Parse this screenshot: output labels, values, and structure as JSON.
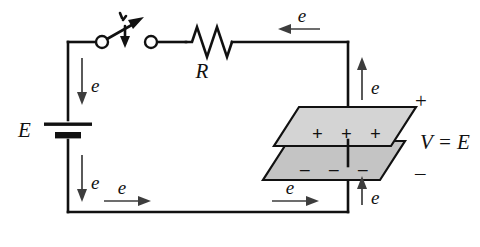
{
  "diagram": {
    "colors": {
      "wire": "#111111",
      "arrow": "#3d3d3d",
      "plate_top_fill": "#d4d4d4",
      "plate_bottom_fill": "#c4c4c4",
      "background": "#ffffff"
    }
  },
  "labels": {
    "source": "E",
    "resistor": "R",
    "voltage_relation": "V  =  E",
    "plus_sign": "+",
    "minus_sign": "–",
    "electron": "e"
  },
  "electron_arrows": [
    {
      "id": "left-upper",
      "label": "e",
      "direction": "down"
    },
    {
      "id": "left-lower",
      "label": "e",
      "direction": "down"
    },
    {
      "id": "bottom-left",
      "label": "e",
      "direction": "right"
    },
    {
      "id": "bottom-right",
      "label": "e",
      "direction": "right"
    },
    {
      "id": "right-lower",
      "label": "e",
      "direction": "up"
    },
    {
      "id": "right-upper",
      "label": "e",
      "direction": "up"
    },
    {
      "id": "top",
      "label": "e",
      "direction": "left"
    }
  ],
  "capacitor": {
    "top_plate_charges": [
      "+",
      "+",
      "+"
    ],
    "bottom_plate_charges": [
      "–",
      "–",
      "–"
    ],
    "terminal_plus": "+",
    "terminal_minus": "–"
  },
  "switch": {
    "state": "open",
    "motion": "closing-downward"
  }
}
